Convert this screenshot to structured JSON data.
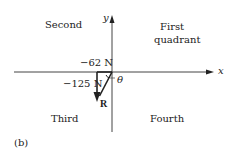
{
  "quadrants": {
    "second": "Second",
    "first_line1": "First",
    "first_line2": "quadrant",
    "third": "Third",
    "fourth": "Fourth"
  },
  "axes": {
    "x_label": "x",
    "y_label": "y"
  },
  "components": {
    "x_component": "−62 N",
    "y_component": "−125 N"
  },
  "vector": {
    "label": "R",
    "angle_label": "θ"
  },
  "figure_label": "(b)"
}
